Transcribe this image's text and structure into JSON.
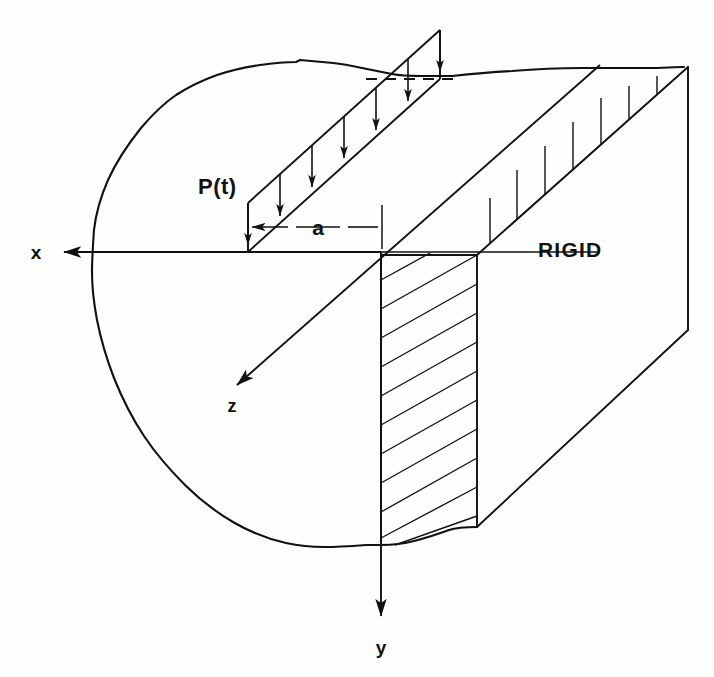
{
  "figure": {
    "background_color": "#fefefe",
    "line_color": "#111111"
  },
  "labels": {
    "load": "P(t)",
    "dimension": "a",
    "material": "RIGID",
    "axis_x": "x",
    "axis_y": "y",
    "axis_z": "z"
  },
  "axes": [
    {
      "name": "x",
      "label": "x",
      "direction": "left",
      "origin": [
        381,
        252
      ],
      "tip": [
        58,
        252
      ],
      "label_pos": [
        36,
        258
      ]
    },
    {
      "name": "y",
      "label": "y",
      "direction": "down",
      "origin": [
        381,
        252
      ],
      "tip": [
        381,
        622
      ],
      "label_pos": [
        381,
        650
      ]
    },
    {
      "name": "z",
      "label": "z",
      "direction": "down-left",
      "origin": [
        600,
        65
      ],
      "tip": [
        231,
        390
      ],
      "label_pos": [
        232,
        409
      ]
    }
  ],
  "load_strip": {
    "label": "P(t)",
    "label_pos": [
      198,
      192
    ],
    "arrow_count": 7,
    "front_left": [
      248,
      252
    ],
    "front_top_left": [
      248,
      203
    ],
    "back_right": [
      440,
      79
    ],
    "dashed_top": {
      "from": [
        368,
        79
      ],
      "to": [
        452,
        79
      ]
    }
  },
  "dimension_line": {
    "label": "a",
    "label_pos": [
      318,
      233
    ],
    "y": 227,
    "from_x": 248,
    "to_x": 382
  },
  "material_label": {
    "text": "RIGID",
    "pos": [
      538,
      256
    ]
  },
  "hatched_section": {
    "left_x": 381,
    "right_x": 477,
    "top_y": 255,
    "bottom_y": 545,
    "hatch_count": 11
  },
  "geometry": {
    "top_back_edge": {
      "from": [
        452,
        76
      ],
      "to": [
        688,
        67
      ]
    },
    "right_vertical_edge": {
      "from": [
        688,
        67
      ],
      "to": [
        688,
        330
      ]
    },
    "receding_edge_top": {
      "from": [
        477,
        255
      ],
      "to": [
        688,
        67
      ]
    },
    "bottom_right_edge": {
      "from": [
        477,
        527
      ],
      "to": [
        688,
        330
      ]
    },
    "surface_line": {
      "from": [
        58,
        252
      ],
      "to": [
        600,
        252
      ]
    }
  }
}
